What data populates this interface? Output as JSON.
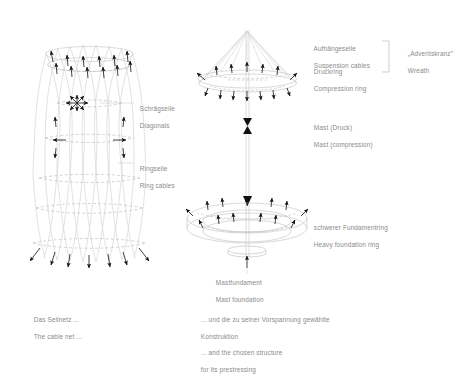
{
  "figure": {
    "title_hidden": "",
    "stroke_color": "#cfcfcf",
    "arrow_color": "#1a1a1a",
    "text_color": "#8a8a8a",
    "background": "#ffffff"
  },
  "left_diagram": {
    "name": "cable-net-hyperboloid",
    "labels": [
      {
        "de": "Schrägseile",
        "en": "Diagonals",
        "x": 136,
        "y": 100
      },
      {
        "de": "Ringseile",
        "en": "Ring cables",
        "x": 136,
        "y": 160
      }
    ],
    "caption": {
      "de": "Das Seilnetz ...",
      "en": "The cable net ...",
      "x": 30,
      "y": 310
    }
  },
  "right_diagram": {
    "name": "mast-and-foundation",
    "labels": [
      {
        "de": "Aufhängeseile",
        "en": "Suspension cables",
        "x": 310,
        "y": 40
      },
      {
        "de": "Druckring",
        "en": "Compression ring",
        "x": 310,
        "y": 63
      },
      {
        "de": "Mast (Druck)",
        "en": "Mast (compression)",
        "x": 310,
        "y": 119
      },
      {
        "de": "schwerer Fundamentring",
        "en": "Heavy foundation ring",
        "x": 310,
        "y": 219
      },
      {
        "de": "Mastfundament",
        "en": "Mast foundation",
        "x": 212,
        "y": 274
      }
    ],
    "bracket_label": {
      "de": "„Adventskranz\"",
      "en": "Wreath",
      "x": 404,
      "y": 45
    },
    "caption": {
      "lines": [
        "... und die zu seiner Vorspannung gewählte",
        "Konstruktion",
        "... and the chosen structure",
        "for its prestressing"
      ],
      "x": 197,
      "y": 311
    }
  }
}
